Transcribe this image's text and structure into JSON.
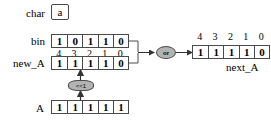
{
  "diagram": {
    "rows": {
      "char": {
        "label": "char",
        "value": "a"
      },
      "bin": {
        "label": "bin",
        "bits": [
          "1",
          "0",
          "1",
          "1",
          "0"
        ]
      },
      "new_A": {
        "label": "new_A",
        "indices": [
          "4",
          "3",
          "2",
          "1",
          "0"
        ],
        "bits": [
          "1",
          "1",
          "1",
          "1",
          "0"
        ]
      },
      "A": {
        "label": "A",
        "bits": [
          "1",
          "1",
          "1",
          "1",
          "1"
        ]
      },
      "next_A": {
        "label": "next_A",
        "indices": [
          "4",
          "3",
          "2",
          "1",
          "0"
        ],
        "bits": [
          "1",
          "1",
          "1",
          "1",
          "0"
        ]
      }
    },
    "operators": {
      "or": "or",
      "shift_left": "<<1"
    },
    "colors": {
      "operator_fill": "#b3b3b3",
      "stroke": "#4a4a4a",
      "background": "#ffffff",
      "text": "#000000"
    }
  }
}
